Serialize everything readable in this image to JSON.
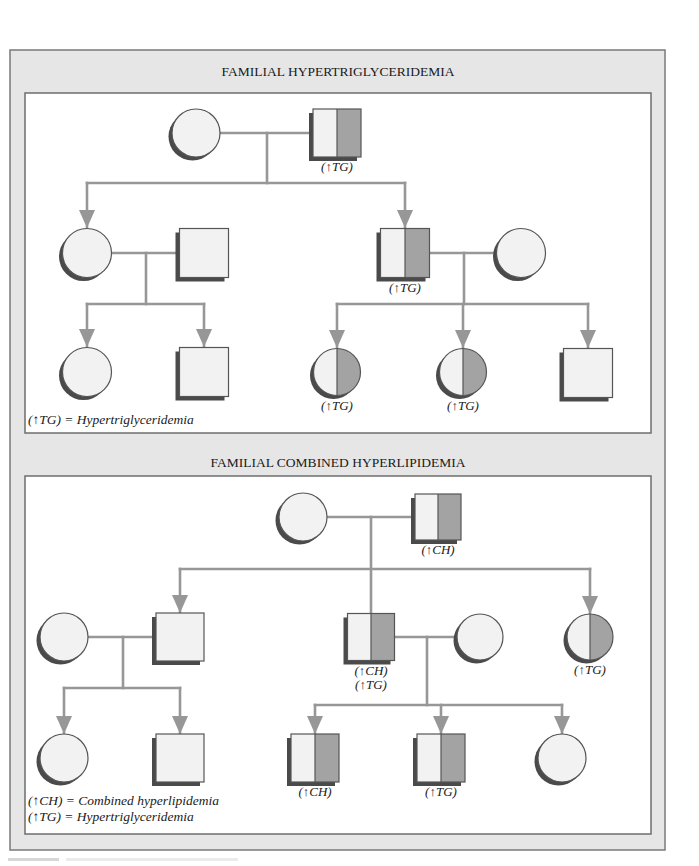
{
  "colors": {
    "frame_bg": "#e6e6e6",
    "frame_border": "#7a7a7a",
    "panel_bg": "#ffffff",
    "panel_border": "#6e6e6e",
    "line": "#979797",
    "symbol_light": "#f2f2f2",
    "symbol_affected": "#a3a3a3",
    "symbol_outline": "#555555",
    "symbol_shadow": "#4a4a4a",
    "text": "#1a1a1a"
  },
  "panels": [
    {
      "id": "familial-hypertriglyceridemia",
      "title": "FAMILIAL HYPERTRIGLYCERIDEMIA",
      "title_pos": [
        338,
        76
      ],
      "rect": [
        25,
        93,
        626,
        340
      ],
      "individuals": [
        {
          "id": "p1-g1-mother",
          "sex": "female",
          "affected": false,
          "cx": 196,
          "cy": 133,
          "size": 48
        },
        {
          "id": "p1-g1-father",
          "sex": "male",
          "affected": true,
          "cx": 337,
          "cy": 133,
          "size": 48,
          "label": [
            "(↑TG)"
          ]
        },
        {
          "id": "p1-g2-daughter",
          "sex": "female",
          "affected": false,
          "cx": 87,
          "cy": 253,
          "size": 49
        },
        {
          "id": "p1-g2-daughter-spouse",
          "sex": "male",
          "affected": false,
          "cx": 204,
          "cy": 253,
          "size": 49
        },
        {
          "id": "p1-g2-son",
          "sex": "male",
          "affected": true,
          "cx": 405,
          "cy": 253,
          "size": 49,
          "label": [
            "(↑TG)"
          ]
        },
        {
          "id": "p1-g2-son-spouse",
          "sex": "female",
          "affected": false,
          "cx": 521,
          "cy": 253,
          "size": 49
        },
        {
          "id": "p1-g3-a",
          "sex": "female",
          "affected": false,
          "cx": 87,
          "cy": 372,
          "size": 49
        },
        {
          "id": "p1-g3-b",
          "sex": "male",
          "affected": false,
          "cx": 204,
          "cy": 372,
          "size": 49
        },
        {
          "id": "p1-g3-c",
          "sex": "female",
          "affected": true,
          "cx": 337,
          "cy": 372,
          "size": 47,
          "label": [
            "(↑TG)"
          ]
        },
        {
          "id": "p1-g3-d",
          "sex": "female",
          "affected": true,
          "cx": 463,
          "cy": 372,
          "size": 47,
          "label": [
            "(↑TG)"
          ]
        },
        {
          "id": "p1-g3-e",
          "sex": "male",
          "affected": false,
          "cx": 588,
          "cy": 373,
          "size": 49
        }
      ],
      "lines": [
        [
          220,
          133,
          313,
          133
        ],
        [
          267,
          133,
          267,
          183
        ],
        [
          87,
          183,
          405,
          183
        ],
        [
          87,
          183,
          87,
          228
        ],
        [
          405,
          183,
          405,
          228
        ],
        [
          112,
          253,
          180,
          253
        ],
        [
          146,
          253,
          146,
          304
        ],
        [
          87,
          304,
          204,
          304
        ],
        [
          87,
          304,
          87,
          347
        ],
        [
          204,
          304,
          204,
          347
        ],
        [
          430,
          253,
          497,
          253
        ],
        [
          464,
          253,
          464,
          304
        ],
        [
          337,
          304,
          588,
          304
        ],
        [
          337,
          304,
          337,
          348
        ],
        [
          463,
          304,
          463,
          348
        ],
        [
          588,
          304,
          588,
          348
        ]
      ],
      "arrows": [
        [
          87,
          228
        ],
        [
          405,
          228
        ],
        [
          87,
          347
        ],
        [
          204,
          347
        ],
        [
          337,
          348
        ],
        [
          463,
          348
        ],
        [
          588,
          348
        ]
      ],
      "legend": [
        "(↑TG) = Hypertriglyceridemia"
      ],
      "legend_pos": [
        28,
        424
      ]
    },
    {
      "id": "familial-combined-hyperlipidemia",
      "title": "FAMILIAL COMBINED HYPERLIPIDEMIA",
      "title_pos": [
        338,
        467
      ],
      "rect": [
        25,
        476,
        626,
        358
      ],
      "individuals": [
        {
          "id": "p2-g1-mother",
          "sex": "female",
          "affected": false,
          "cx": 303,
          "cy": 517,
          "size": 48
        },
        {
          "id": "p2-g1-father",
          "sex": "male",
          "affected": true,
          "cx": 438,
          "cy": 517,
          "size": 46,
          "label": [
            "(↑CH)"
          ]
        },
        {
          "id": "p2-g2-daughter-spouse-f",
          "sex": "female",
          "affected": false,
          "cx": 64,
          "cy": 637,
          "size": 48
        },
        {
          "id": "p2-g2-son-a",
          "sex": "male",
          "affected": false,
          "cx": 180,
          "cy": 637,
          "size": 48
        },
        {
          "id": "p2-g2-son-b",
          "sex": "male",
          "affected": true,
          "cx": 371,
          "cy": 637,
          "size": 47,
          "label": [
            "(↑CH)",
            "(↑TG)"
          ]
        },
        {
          "id": "p2-g2-son-b-spouse",
          "sex": "female",
          "affected": false,
          "cx": 480,
          "cy": 637,
          "size": 46
        },
        {
          "id": "p2-g2-daughter",
          "sex": "female",
          "affected": true,
          "cx": 590,
          "cy": 637,
          "size": 46,
          "label": [
            "(↑TG)"
          ]
        },
        {
          "id": "p2-g3-a",
          "sex": "female",
          "affected": false,
          "cx": 64,
          "cy": 758,
          "size": 48
        },
        {
          "id": "p2-g3-b",
          "sex": "male",
          "affected": false,
          "cx": 180,
          "cy": 758,
          "size": 48
        },
        {
          "id": "p2-g3-c",
          "sex": "male",
          "affected": true,
          "cx": 315,
          "cy": 758,
          "size": 48,
          "label": [
            "(↑CH)"
          ]
        },
        {
          "id": "p2-g3-d",
          "sex": "male",
          "affected": true,
          "cx": 441,
          "cy": 758,
          "size": 48,
          "label": [
            "(↑TG)"
          ]
        },
        {
          "id": "p2-g3-e",
          "sex": "female",
          "affected": false,
          "cx": 562,
          "cy": 758,
          "size": 48
        }
      ],
      "lines": [
        [
          327,
          517,
          415,
          517
        ],
        [
          371,
          517,
          371,
          613
        ],
        [
          180,
          569,
          590,
          569
        ],
        [
          180,
          569,
          180,
          613
        ],
        [
          590,
          569,
          590,
          614
        ],
        [
          88,
          637,
          156,
          637
        ],
        [
          123,
          637,
          123,
          688
        ],
        [
          64,
          688,
          180,
          688
        ],
        [
          64,
          688,
          64,
          734
        ],
        [
          180,
          688,
          180,
          734
        ],
        [
          394,
          637,
          457,
          637
        ],
        [
          427,
          637,
          427,
          705
        ],
        [
          315,
          705,
          562,
          705
        ],
        [
          315,
          705,
          315,
          734
        ],
        [
          441,
          705,
          441,
          734
        ],
        [
          562,
          705,
          562,
          734
        ]
      ],
      "arrows": [
        [
          180,
          613
        ],
        [
          590,
          614
        ],
        [
          64,
          734
        ],
        [
          180,
          734
        ],
        [
          315,
          734
        ],
        [
          441,
          734
        ],
        [
          562,
          734
        ]
      ],
      "legend": [
        "(↑CH) = Combined hyperlipidemia",
        "(↑TG) = Hypertriglyceridemia"
      ],
      "legend_pos": [
        28,
        805
      ]
    }
  ],
  "frame": {
    "x": 10,
    "y": 50,
    "w": 655,
    "h": 800
  }
}
